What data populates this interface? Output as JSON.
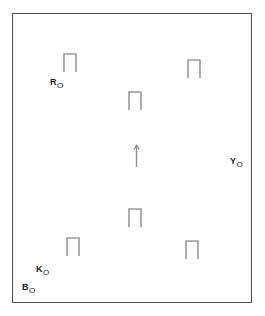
{
  "figure": {
    "background_color": "#ffffff",
    "frame": {
      "stroke_color": "#4a4a4a",
      "stroke_width": 1,
      "x": 12,
      "y": 13,
      "width": 240,
      "height": 290
    },
    "marks": [
      {
        "id": "mark-top-left",
        "shape": "staple",
        "x": 62,
        "y": 52,
        "width": 16,
        "height": 21,
        "stroke_color": "#9a9a9a"
      },
      {
        "id": "mark-top-right",
        "shape": "staple",
        "x": 186,
        "y": 58,
        "width": 16,
        "height": 21,
        "stroke_color": "#9a9a9a"
      },
      {
        "id": "mark-upper-center",
        "shape": "staple",
        "x": 127,
        "y": 90,
        "width": 16,
        "height": 21,
        "stroke_color": "#9a9a9a"
      },
      {
        "id": "mark-center-arrow",
        "shape": "arrow-up",
        "x": 132,
        "y": 144,
        "width": 8,
        "height": 22,
        "stroke_color": "#8f8f8f"
      },
      {
        "id": "mark-lower-center",
        "shape": "staple",
        "x": 127,
        "y": 207,
        "width": 16,
        "height": 21,
        "stroke_color": "#9a9a9a"
      },
      {
        "id": "mark-bottom-left",
        "shape": "staple",
        "x": 65,
        "y": 236,
        "width": 16,
        "height": 21,
        "stroke_color": "#9a9a9a"
      },
      {
        "id": "mark-bottom-right",
        "shape": "staple",
        "x": 184,
        "y": 239,
        "width": 16,
        "height": 21,
        "stroke_color": "#9a9a9a"
      }
    ],
    "labels": [
      {
        "id": "label-R0",
        "base": "R",
        "subscript": "O",
        "x": 50,
        "y": 78
      },
      {
        "id": "label-Y0",
        "base": "Y",
        "subscript": "O",
        "x": 230,
        "y": 157
      },
      {
        "id": "label-K0",
        "base": "K",
        "subscript": "O",
        "x": 36,
        "y": 265
      },
      {
        "id": "label-B0",
        "base": "B",
        "subscript": "O",
        "x": 22,
        "y": 283
      }
    ]
  }
}
